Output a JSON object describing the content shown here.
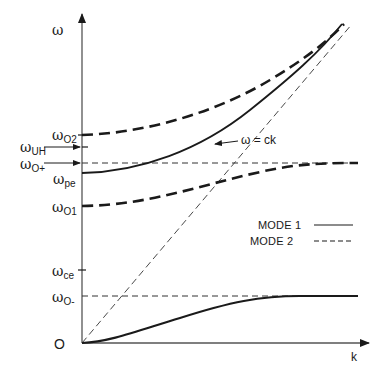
{
  "diagram": {
    "axes": {
      "y_label": "ω",
      "x_label": "k",
      "origin_label": "O"
    },
    "y_markers": [
      {
        "id": "o2",
        "symbol": "ω",
        "sub": "O2",
        "kind": "tick"
      },
      {
        "id": "uh",
        "symbol": "ω",
        "sub": "UH",
        "kind": "arrow"
      },
      {
        "id": "oplus",
        "symbol": "ω",
        "sub": "O+",
        "kind": "arrow"
      },
      {
        "id": "pe",
        "symbol": "ω",
        "sub": "pe",
        "kind": "label"
      },
      {
        "id": "o1",
        "symbol": "ω",
        "sub": "O1",
        "kind": "label"
      },
      {
        "id": "ce",
        "symbol": "ω",
        "sub": "ce",
        "kind": "tick"
      },
      {
        "id": "ominus",
        "symbol": "ω",
        "sub": "O-",
        "kind": "label"
      }
    ],
    "light_line_label": "ω = ck",
    "legend": [
      {
        "label": "MODE 1",
        "style": "solid"
      },
      {
        "label": "MODE 2",
        "style": "dashed"
      }
    ],
    "colors": {
      "ink": "#1a1a1a",
      "axis": "#555555",
      "background": "#ffffff"
    }
  }
}
